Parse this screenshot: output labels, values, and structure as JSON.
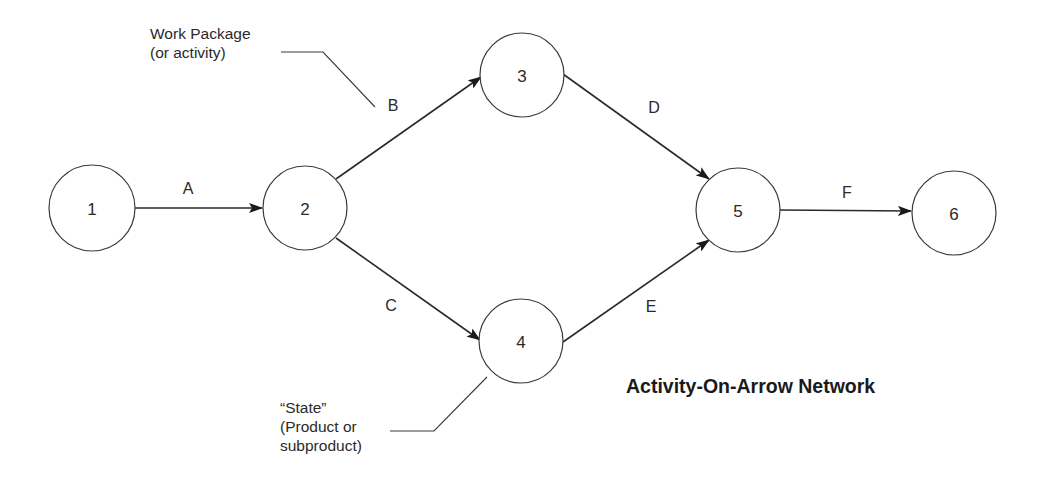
{
  "diagram": {
    "title": "Activity-On-Arrow Network",
    "nodes": [
      {
        "id": "1",
        "label": "1",
        "cx": 92,
        "cy": 208,
        "r": 43
      },
      {
        "id": "2",
        "label": "2",
        "cx": 305,
        "cy": 208,
        "r": 42
      },
      {
        "id": "3",
        "label": "3",
        "cx": 522,
        "cy": 75,
        "r": 42
      },
      {
        "id": "4",
        "label": "4",
        "cx": 521,
        "cy": 341,
        "r": 42
      },
      {
        "id": "5",
        "label": "5",
        "cx": 738,
        "cy": 210,
        "r": 42
      },
      {
        "id": "6",
        "label": "6",
        "cx": 954,
        "cy": 213,
        "r": 42
      }
    ],
    "edges": [
      {
        "id": "A",
        "label": "A",
        "from": "1",
        "to": "2"
      },
      {
        "id": "B",
        "label": "B",
        "from": "2",
        "to": "3"
      },
      {
        "id": "C",
        "label": "C",
        "from": "2",
        "to": "4"
      },
      {
        "id": "D",
        "label": "D",
        "from": "3",
        "to": "5"
      },
      {
        "id": "E",
        "label": "E",
        "from": "4",
        "to": "5"
      },
      {
        "id": "F",
        "label": "F",
        "from": "5",
        "to": "6"
      }
    ],
    "annotations": {
      "work_package": {
        "line1": "Work Package",
        "line2": "(or activity)",
        "points_to": "B"
      },
      "state": {
        "line1": "“State”",
        "line2": "(Product or",
        "line3": "subproduct)",
        "points_to": "4"
      }
    },
    "colors": {
      "stroke": "#2a2a2a",
      "background": "#ffffff",
      "text": "#2a2a2a"
    }
  }
}
